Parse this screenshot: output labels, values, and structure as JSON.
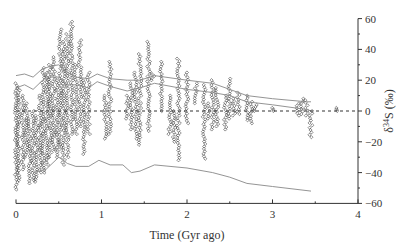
{
  "chart_data": {
    "type": "scatter",
    "title": "",
    "xlabel": "Time (Gyr ago)",
    "ylabel": "δ34S (‰)",
    "ylabel_parts": {
      "delta": "δ",
      "mass": "34",
      "elem": "S",
      "unit": "(‰)"
    },
    "xlim": [
      0,
      4
    ],
    "ylim": [
      -60,
      60
    ],
    "x_ticks": [
      0,
      1,
      2,
      3,
      4
    ],
    "x_tick_labels": [
      "0",
      "1",
      "2",
      "3",
      "4"
    ],
    "x_minor_ticks": [
      0.5,
      1.5,
      2.5,
      3.5
    ],
    "y_ticks": [
      60,
      40,
      20,
      0,
      -20,
      -40,
      -60
    ],
    "y_tick_labels": [
      "60",
      "40",
      "20",
      "0",
      "−20",
      "−40",
      "−60"
    ],
    "y_axis_position": "right",
    "grid": false,
    "reference_line": {
      "y": 0,
      "style": "dashed"
    },
    "marker": "open-diamond",
    "series": [
      {
        "name": "sulfide/sulfate δ34S measurements",
        "kind": "scatter-columns",
        "columns": [
          {
            "t": 0.0,
            "min": -51,
            "max": 18
          },
          {
            "t": 0.03,
            "min": -45,
            "max": 15
          },
          {
            "t": 0.08,
            "min": -38,
            "max": 10
          },
          {
            "t": 0.12,
            "min": -30,
            "max": 5
          },
          {
            "t": 0.16,
            "min": -47,
            "max": -5
          },
          {
            "t": 0.2,
            "min": -45,
            "max": 0
          },
          {
            "t": 0.24,
            "min": -46,
            "max": -3
          },
          {
            "t": 0.28,
            "min": -40,
            "max": 10
          },
          {
            "t": 0.32,
            "min": -40,
            "max": 28
          },
          {
            "t": 0.36,
            "min": -35,
            "max": 25
          },
          {
            "t": 0.4,
            "min": -30,
            "max": 30
          },
          {
            "t": 0.44,
            "min": -25,
            "max": 35
          },
          {
            "t": 0.48,
            "min": -30,
            "max": 20
          },
          {
            "t": 0.52,
            "min": -25,
            "max": 53
          },
          {
            "t": 0.56,
            "min": -35,
            "max": 45
          },
          {
            "t": 0.6,
            "min": -30,
            "max": 50
          },
          {
            "t": 0.65,
            "min": -15,
            "max": 58
          },
          {
            "t": 0.7,
            "min": -15,
            "max": 30
          },
          {
            "t": 0.75,
            "min": -10,
            "max": 46
          },
          {
            "t": 0.8,
            "min": -28,
            "max": 20
          },
          {
            "t": 0.85,
            "min": -15,
            "max": 25
          },
          {
            "t": 1.05,
            "min": -18,
            "max": 10
          },
          {
            "t": 1.1,
            "min": -15,
            "max": 32
          },
          {
            "t": 1.3,
            "min": -5,
            "max": 10
          },
          {
            "t": 1.35,
            "min": -12,
            "max": 18
          },
          {
            "t": 1.4,
            "min": -18,
            "max": 25
          },
          {
            "t": 1.45,
            "min": -22,
            "max": 37
          },
          {
            "t": 1.55,
            "min": -13,
            "max": 45
          },
          {
            "t": 1.6,
            "min": 20,
            "max": 24
          },
          {
            "t": 1.7,
            "min": 0,
            "max": 32
          },
          {
            "t": 1.8,
            "min": -15,
            "max": 10
          },
          {
            "t": 1.85,
            "min": -20,
            "max": 0
          },
          {
            "t": 1.9,
            "min": -32,
            "max": 34
          },
          {
            "t": 2.0,
            "min": -8,
            "max": 25
          },
          {
            "t": 2.1,
            "min": 5,
            "max": 18
          },
          {
            "t": 2.2,
            "min": -31,
            "max": 17
          },
          {
            "t": 2.25,
            "min": -5,
            "max": 5
          },
          {
            "t": 2.3,
            "min": -12,
            "max": 20
          },
          {
            "t": 2.35,
            "min": -10,
            "max": 15
          },
          {
            "t": 2.45,
            "min": -12,
            "max": 10
          },
          {
            "t": 2.5,
            "min": -5,
            "max": 21
          },
          {
            "t": 2.55,
            "min": -3,
            "max": 8
          },
          {
            "t": 2.6,
            "min": -2,
            "max": 12
          },
          {
            "t": 2.7,
            "min": -6,
            "max": 10
          },
          {
            "t": 2.75,
            "min": -8,
            "max": 6
          },
          {
            "t": 2.8,
            "min": 0,
            "max": 4
          },
          {
            "t": 3.0,
            "min": 0,
            "max": 2
          },
          {
            "t": 3.3,
            "min": -3,
            "max": 5
          },
          {
            "t": 3.35,
            "min": -2,
            "max": 8
          },
          {
            "t": 3.4,
            "min": -3,
            "max": 7
          },
          {
            "t": 3.45,
            "min": -17,
            "max": 0
          },
          {
            "t": 3.75,
            "min": 0,
            "max": 2
          }
        ]
      },
      {
        "name": "upper envelope 1",
        "kind": "line",
        "x": [
          0,
          0.1,
          0.2,
          0.3,
          0.4,
          0.5,
          0.6,
          0.7,
          0.85,
          0.95,
          1.1,
          1.3,
          1.45,
          1.62,
          2.0,
          2.3,
          2.5,
          2.7,
          3.0,
          3.4,
          3.45
        ],
        "y": [
          23,
          24,
          22,
          27,
          29,
          30,
          25,
          22,
          21,
          24,
          21,
          20,
          20,
          23,
          20,
          18,
          14,
          10,
          8,
          6,
          6
        ]
      },
      {
        "name": "upper envelope 2",
        "kind": "line",
        "x": [
          0,
          0.1,
          0.2,
          0.35,
          0.5,
          0.6,
          0.7,
          0.85,
          0.95,
          1.1,
          1.3,
          1.45,
          1.62,
          2.0,
          2.3,
          2.5,
          2.7,
          3.0,
          3.4,
          3.45
        ],
        "y": [
          15,
          17,
          14,
          22,
          22,
          17,
          17,
          15,
          19,
          16,
          13,
          15,
          18,
          14,
          12,
          10,
          6,
          4,
          1,
          0
        ]
      },
      {
        "name": "lower envelope",
        "kind": "line",
        "x": [
          0.2,
          0.35,
          0.5,
          0.6,
          0.7,
          0.85,
          0.97,
          1.1,
          1.25,
          1.35,
          1.45,
          1.62,
          2.0,
          2.3,
          2.5,
          2.7,
          3.0,
          3.45
        ],
        "y": [
          -40,
          -38,
          -30,
          -34,
          -36,
          -36,
          -32,
          -35,
          -35,
          -40,
          -39,
          -35,
          -37,
          -40,
          -43,
          -47,
          -49,
          -52
        ]
      }
    ]
  },
  "colors": {
    "axis": "#333333",
    "markers": "#444444",
    "lines": "#888888",
    "reference": "#333333",
    "background": "#ffffff"
  }
}
